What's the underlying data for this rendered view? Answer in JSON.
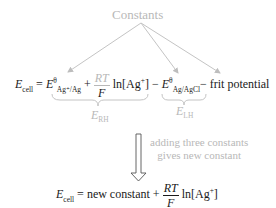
{
  "title": "Constants",
  "equation1": {
    "lhs_E": "E",
    "lhs_sub": "cell",
    "eq": "=",
    "term1_E": "E",
    "term1_sup": "θ",
    "term1_sub": "Ag⁺/Ag",
    "plus": "+",
    "frac_num": "RT",
    "frac_den": "F",
    "ln": "ln[Ag",
    "ln_sup": "+",
    "ln_close": "]",
    "minus1": "−",
    "term2_E": "E",
    "term2_sup": "θ",
    "term2_sub": "Ag/AgCl",
    "minus2": "−",
    "frit": "frit potential"
  },
  "brace_labels": {
    "rhs_E": "E",
    "rhs_sub": "RH",
    "lhs_E": "E",
    "lhs_sub": "LH"
  },
  "arrow_caption": {
    "line1": "adding three constants",
    "line2": "gives new constant"
  },
  "equation2": {
    "lhs_E": "E",
    "lhs_sub": "cell",
    "eq": "=",
    "const": "new constant",
    "plus": "+",
    "frac_num": "RT",
    "frac_den": "F",
    "ln": "ln[Ag",
    "ln_sup": "+",
    "ln_close": "]"
  },
  "colors": {
    "ink": "#1a1a1a",
    "annotation": "#b8b8b8"
  }
}
